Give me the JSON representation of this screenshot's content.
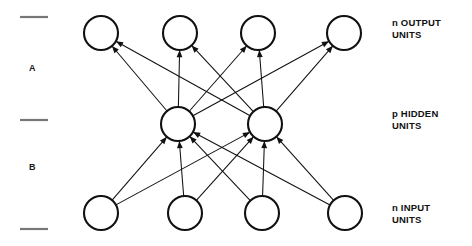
{
  "figure": {
    "background_color": "#ffffff",
    "stroke_color": "#111111",
    "tick_color": "#777777"
  },
  "layers": [
    {
      "id": "output",
      "label_prefix": "n",
      "label_line1": "n OUTPUT",
      "label_line2": "UNITS",
      "count": 4,
      "cy": 33,
      "radius": 17,
      "node_x": [
        101,
        180,
        258,
        344
      ]
    },
    {
      "id": "hidden",
      "label_prefix": "p",
      "label_line1": "p HIDDEN",
      "label_line2": "UNITS",
      "count": 2,
      "cy": 124,
      "radius": 17,
      "node_x": [
        178,
        265
      ]
    },
    {
      "id": "input",
      "label_prefix": "n",
      "label_line1": "n INPUT",
      "label_line2": "UNITS",
      "count": 4,
      "cy": 213,
      "radius": 17,
      "node_x": [
        101,
        185,
        262,
        345
      ]
    }
  ],
  "regions": [
    {
      "id": "A",
      "label": "A",
      "x": 29,
      "y": 63,
      "between": [
        "hidden",
        "output"
      ]
    },
    {
      "id": "B",
      "label": "B",
      "x": 29,
      "y": 162,
      "between": [
        "input",
        "hidden"
      ]
    }
  ],
  "ticks": [
    {
      "id": "tick-top",
      "x1": 20,
      "x2": 48,
      "y": 17
    },
    {
      "id": "tick-middle",
      "x1": 20,
      "x2": 48,
      "y": 120
    },
    {
      "id": "tick-bottom",
      "x1": 20,
      "x2": 48,
      "y": 229
    }
  ],
  "labels": {
    "output": {
      "x": 392,
      "y": 17,
      "line1": "n OUTPUT",
      "line2": "UNITS"
    },
    "hidden": {
      "x": 392,
      "y": 108,
      "line1": "p HIDDEN",
      "line2": "UNITS"
    },
    "input": {
      "x": 392,
      "y": 202,
      "line1": "n INPUT",
      "line2": "UNITS"
    }
  },
  "connections": {
    "input_to_hidden": {
      "description": "fully connected, arrows point upward into hidden units",
      "direction": "upward",
      "edges": [
        [
          0,
          0
        ],
        [
          0,
          1
        ],
        [
          1,
          0
        ],
        [
          1,
          1
        ],
        [
          2,
          0
        ],
        [
          2,
          1
        ],
        [
          3,
          0
        ],
        [
          3,
          1
        ]
      ]
    },
    "hidden_to_output": {
      "description": "fully connected, arrows point upward into output units",
      "direction": "upward",
      "edges": [
        [
          0,
          0
        ],
        [
          0,
          1
        ],
        [
          0,
          2
        ],
        [
          0,
          3
        ],
        [
          1,
          0
        ],
        [
          1,
          1
        ],
        [
          1,
          2
        ],
        [
          1,
          3
        ]
      ]
    }
  }
}
